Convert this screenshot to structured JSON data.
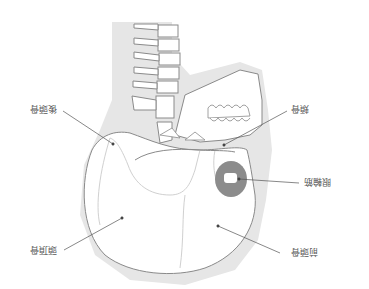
{
  "diagram": {
    "orientation": "rotated 180 degrees",
    "colors": {
      "background_silhouette": "#e6e6e6",
      "outline": "#8a8a8a",
      "suture": "#cfcfcf",
      "muscle_highlight": "#8c8c8c",
      "leader_line": "#555555",
      "label_text": "#555555"
    },
    "labels": [
      {
        "id": "occipital",
        "text": "後頭骨",
        "meaning": "occipital bone"
      },
      {
        "id": "zygomatic",
        "text": "頬骨",
        "meaning": "zygomatic bone"
      },
      {
        "id": "orbicularis",
        "text": "眼輪筋",
        "meaning": "orbicularis oculi muscle"
      },
      {
        "id": "parietal",
        "text": "頭頂骨",
        "meaning": "parietal bone"
      },
      {
        "id": "frontal",
        "text": "前頭骨",
        "meaning": "frontal bone"
      }
    ]
  }
}
